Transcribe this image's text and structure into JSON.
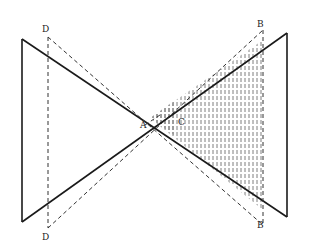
{
  "diagram": {
    "type": "geometric-optics-sketch",
    "labels": {
      "D_top": "D",
      "D_bottom": "D",
      "B_top": "B",
      "B_bottom": "B",
      "A": "A",
      "C": "C"
    },
    "colors": {
      "ink": "#1a1a1a",
      "background": "#ffffff"
    }
  }
}
